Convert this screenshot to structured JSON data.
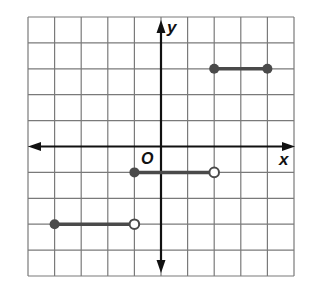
{
  "chart_data": {
    "type": "line",
    "title": "",
    "xlabel": "x",
    "ylabel": "y",
    "origin_label": "O",
    "xlim": [
      -5,
      5
    ],
    "ylim": [
      -5,
      5
    ],
    "grid": true,
    "grid_step": 1,
    "tick_labels_shown": false,
    "segments": [
      {
        "x_start": -4,
        "x_end": -1,
        "y": -3,
        "start": "closed",
        "end": "open"
      },
      {
        "x_start": -1,
        "x_end": 2,
        "y": -1,
        "start": "closed",
        "end": "open"
      },
      {
        "x_start": 2,
        "x_end": 4,
        "y": 3,
        "start": "closed",
        "end": "closed"
      }
    ]
  },
  "colors": {
    "grid": "#7a7a7a",
    "axis": "#111111",
    "segment": "#4a4a4a",
    "open_fill": "#ffffff"
  }
}
